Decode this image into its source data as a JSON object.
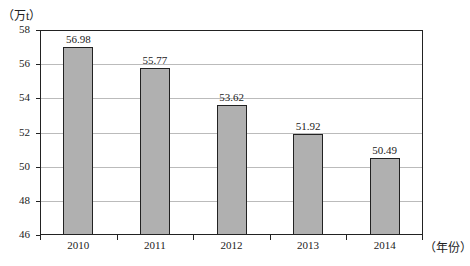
{
  "chart_data": {
    "type": "bar",
    "title": "",
    "xlabel": "（年份）",
    "ylabel": "（万t）",
    "categories": [
      "2010",
      "2011",
      "2012",
      "2013",
      "2014"
    ],
    "values": [
      56.98,
      55.77,
      53.62,
      51.92,
      50.49
    ],
    "value_labels": [
      "56.98",
      "55.77",
      "53.62",
      "51.92",
      "50.49"
    ],
    "ylim": [
      46,
      58
    ],
    "yticks": [
      "58",
      "56",
      "54",
      "52",
      "50",
      "48",
      "46"
    ],
    "grid": true,
    "legend": null,
    "bar_color": "#b0b0b0"
  }
}
